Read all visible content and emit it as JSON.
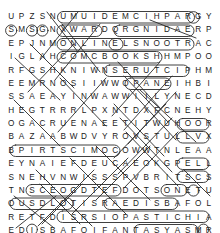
{
  "puzzle": {
    "type": "word-search",
    "rows": 16,
    "cols": 20,
    "grid": [
      [
        "U",
        "P",
        "Z",
        "S",
        "N",
        "U",
        "M",
        "U",
        "I",
        "D",
        "E",
        "M",
        "C",
        "I",
        "H",
        "P",
        "A",
        "R",
        "G",
        "Y"
      ],
      [
        "S",
        "M",
        "S",
        "G",
        "N",
        "X",
        "W",
        "A",
        "R",
        "D",
        "Q",
        "R",
        "G",
        "N",
        "I",
        "D",
        "A",
        "E",
        "R",
        "P"
      ],
      [
        "E",
        "P",
        "J",
        "N",
        "M",
        "O",
        "N",
        "L",
        "I",
        "N",
        "E",
        "L",
        "S",
        "N",
        "O",
        "O",
        "T",
        "R",
        "A",
        "C"
      ],
      [
        "I",
        "G",
        "L",
        "A",
        "H",
        "C",
        "O",
        "M",
        "C",
        "B",
        "O",
        "O",
        "K",
        "S",
        "H",
        "H",
        "M",
        "P",
        "O",
        "O"
      ],
      [
        "R",
        "F",
        "G",
        "S",
        "H",
        "K",
        "N",
        "I",
        "W",
        "N",
        "S",
        "E",
        "R",
        "U",
        "T",
        "C",
        "I",
        "P",
        "H",
        "M"
      ],
      [
        "E",
        "E",
        "M",
        "R",
        "N",
        "O",
        "S",
        "I",
        "I",
        "W",
        "W",
        "O",
        "P",
        "A",
        "N",
        "E",
        "I",
        "H",
        "B",
        "I"
      ],
      [
        "S",
        "S",
        "A",
        "E",
        "A",
        "Y",
        "I",
        "N",
        "W",
        "A",
        "W",
        "W",
        "I",
        "I",
        "L",
        "Y",
        "N",
        "E",
        "C",
        "D"
      ],
      [
        "H",
        "E",
        "G",
        "T",
        "R",
        "R",
        "R",
        "L",
        "P",
        "X",
        "N",
        "T",
        "D",
        "X",
        "F",
        "C",
        "N",
        "E",
        "H",
        "Y"
      ],
      [
        "O",
        "G",
        "A",
        "C",
        "R",
        "U",
        "E",
        "N",
        "A",
        "E",
        "E",
        "T",
        "I",
        "T",
        "W",
        "U",
        "H",
        "O",
        "O",
        "R"
      ],
      [
        "B",
        "A",
        "Z",
        "A",
        "A",
        "B",
        "W",
        "D",
        "V",
        "Y",
        "R",
        "O",
        "V",
        "S",
        "T",
        "U",
        "L",
        "L",
        "V",
        "X"
      ],
      [
        "B",
        "P",
        "I",
        "R",
        "T",
        "S",
        "C",
        "I",
        "M",
        "O",
        "C",
        "O",
        "W",
        "W",
        "T",
        "N",
        "L",
        "E",
        "A",
        "A"
      ],
      [
        "E",
        "Y",
        "N",
        "A",
        "I",
        "E",
        "F",
        "D",
        "E",
        "U",
        "C",
        "A",
        "E",
        "O",
        "K",
        "G",
        "P",
        "E",
        "L",
        "L"
      ],
      [
        "S",
        "N",
        "E",
        "H",
        "V",
        "N",
        "W",
        "I",
        "S",
        "S",
        "S",
        "P",
        "V",
        "B",
        "R",
        "I",
        "T",
        "S",
        "C",
        "S"
      ],
      [
        "T",
        "N",
        "S",
        "C",
        "E",
        "O",
        "G",
        "D",
        "T",
        "E",
        "F",
        "D",
        "O",
        "T",
        "S",
        "O",
        "N",
        "E",
        "T",
        "U"
      ],
      [
        "O",
        "U",
        "S",
        "D",
        "L",
        "O",
        "T",
        "I",
        "S",
        "R",
        "A",
        "E",
        "D",
        "I",
        "S",
        "B",
        "A",
        "F",
        "O",
        "L"
      ],
      [
        "R",
        "E",
        "T",
        "F",
        "D",
        "I",
        "S",
        "R",
        "S",
        "I",
        "O",
        "P",
        "A",
        "S",
        "T",
        "I",
        "C",
        "H",
        "I",
        "A"
      ],
      [
        "E",
        "D",
        "I",
        "S",
        "B",
        "A",
        "F",
        "O",
        "I",
        "F",
        "A",
        "N",
        "T",
        "A",
        "S",
        "Y",
        "A",
        "S",
        "M",
        "R"
      ],
      [
        "S",
        "D",
        "P",
        "A",
        "S",
        "N",
        "O",
        "I",
        "T",
        "N",
        "E",
        "V",
        "N",
        "O",
        "C",
        "A",
        "G",
        "N",
        "A",
        "M"
      ],
      [
        "O",
        "X",
        "S",
        "A",
        "V",
        "E",
        "P",
        "B",
        "A",
        "C",
        "Z",
        "R",
        "Y",
        "C",
        "A",
        "L",
        "V",
        "I",
        "N",
        "Q"
      ]
    ],
    "found_words": [
      "GRAPHIC MEDIUM",
      "READING",
      "CARTOONS",
      "ONLINE",
      "COMIC BOOKS",
      "PICTURES",
      "COMIC STRIPS",
      "FANTASY",
      "MANGA CONVENTION",
      "CALVIN",
      "PASTICHE",
      "SUPERHERO"
    ],
    "ink_color": "#1b1b1b",
    "background_color": "#ffffff"
  }
}
